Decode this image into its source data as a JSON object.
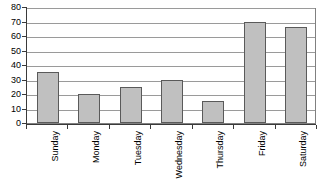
{
  "chart_data": {
    "type": "bar",
    "title": "",
    "subtitle": "",
    "xlabel": "",
    "ylabel": "",
    "categories": [
      "Sunday",
      "Monday",
      "Tuesday",
      "Wednesday",
      "Thursday",
      "Friday",
      "Saturday"
    ],
    "values": [
      35,
      20,
      25,
      30,
      15,
      70,
      66
    ],
    "ylim": [
      0,
      80
    ],
    "ytick_step": 10,
    "yticks": [
      "0",
      "10",
      "20",
      "30",
      "40",
      "50",
      "60",
      "70",
      "80"
    ],
    "grid": "horizontal",
    "legend": "none",
    "series": [
      {
        "name": "",
        "values": [
          35,
          20,
          25,
          30,
          15,
          70,
          66
        ]
      }
    ],
    "colors": {
      "bar_fill": "#c0c0c0",
      "bar_border": "#5a5a5a",
      "gridline": "#9a9a9a",
      "axis": "#3a3a3a",
      "plot_background": "#ffffff",
      "text": "#000000"
    }
  }
}
